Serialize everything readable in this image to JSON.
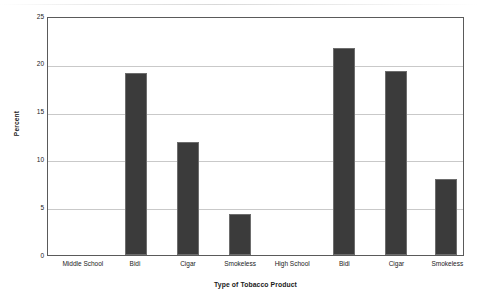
{
  "chart_data": {
    "type": "bar",
    "title": "",
    "xlabel": "Type of Tobacco Product",
    "ylabel": "Percent",
    "ylim": [
      0,
      25
    ],
    "yticks": [
      0,
      5,
      10,
      15,
      20,
      25
    ],
    "ytick_labels": [
      "0",
      "5",
      "10",
      "15",
      "20",
      "25"
    ],
    "grid": true,
    "legend": "none",
    "categories": [
      "Middle School",
      "Bidi",
      "Cigar",
      "Smokeless",
      "High School",
      "Bidi",
      "Cigar",
      "Smokeless"
    ],
    "values": [
      null,
      19.0,
      11.8,
      4.3,
      null,
      21.7,
      19.2,
      8.0
    ],
    "bars": [
      {
        "label": "Middle School",
        "value": null,
        "group": "Middle School",
        "center_pct": 8.6,
        "width_pct": 5.3
      },
      {
        "label": "Bidi",
        "value": 19.0,
        "group": "Middle School",
        "center_pct": 21.1,
        "width_pct": 5.3
      },
      {
        "label": "Cigar",
        "value": 11.8,
        "group": "Middle School",
        "center_pct": 33.8,
        "width_pct": 5.3
      },
      {
        "label": "Smokeless",
        "value": 4.3,
        "group": "Middle School",
        "center_pct": 46.3,
        "width_pct": 5.3
      },
      {
        "label": "High School",
        "value": null,
        "group": "High School",
        "center_pct": 58.8,
        "width_pct": 5.3
      },
      {
        "label": "Bidi",
        "value": 21.7,
        "group": "High School",
        "center_pct": 71.3,
        "width_pct": 5.3
      },
      {
        "label": "Cigar",
        "value": 19.2,
        "group": "High School",
        "center_pct": 83.8,
        "width_pct": 5.3
      },
      {
        "label": "Smokeless",
        "value": 8.0,
        "group": "High School",
        "center_pct": 96.0,
        "width_pct": 5.3
      }
    ],
    "colors": {
      "bar_fill": "#3b3b3b",
      "bar_edge": "#6d6d6d",
      "gridline": "#c9c9c9",
      "axis": "#5a5a5a",
      "text": "#222222",
      "background": "#ffffff"
    }
  }
}
